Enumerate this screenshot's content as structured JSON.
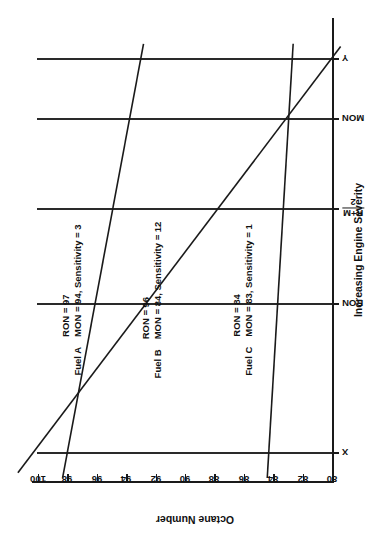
{
  "chart_data": {
    "type": "line",
    "title": "",
    "xlabel": "Increasing Engine Severity",
    "ylabel": "Octane Number",
    "x_tick_labels": [
      "X",
      "RON",
      "(R+M)/2",
      "MON",
      "Y"
    ],
    "x_tick_display": [
      "X",
      "RON",
      "R+M / 2",
      "MON",
      "Y"
    ],
    "y_tick_labels": [
      "100",
      "98",
      "96",
      "94",
      "92",
      "90",
      "88",
      "86",
      "84",
      "82",
      "80"
    ],
    "ylim": [
      80,
      100
    ],
    "grid": "both",
    "legend": "inline-annotations",
    "series": [
      {
        "name": "Fuel A",
        "ron": 97,
        "mon": 94,
        "sensitivity": 3,
        "points": [
          {
            "x": "X",
            "y": 98.0
          },
          {
            "x": "RON",
            "y": 97.0
          },
          {
            "x": "(R+M)/2",
            "y": 95.5
          },
          {
            "x": "MON",
            "y": 94.0
          },
          {
            "x": "Y",
            "y": 93.0
          }
        ]
      },
      {
        "name": "Fuel B",
        "ron": 96,
        "mon": 84,
        "sensitivity": 12,
        "points": [
          {
            "x": "X",
            "y": 100.3
          },
          {
            "x": "RON",
            "y": 96.0
          },
          {
            "x": "(R+M)/2",
            "y": 90.0
          },
          {
            "x": "MON",
            "y": 84.0
          },
          {
            "x": "Y",
            "y": 80.0
          }
        ]
      },
      {
        "name": "Fuel C",
        "ron": 84,
        "mon": 83,
        "sensitivity": 1,
        "points": [
          {
            "x": "X",
            "y": 84.3
          },
          {
            "x": "RON",
            "y": 84.0
          },
          {
            "x": "(R+M)/2",
            "y": 83.5
          },
          {
            "x": "MON",
            "y": 83.0
          },
          {
            "x": "Y",
            "y": 82.7
          }
        ]
      }
    ],
    "annotations": [
      {
        "name": "Fuel A",
        "line1": "RON = 97",
        "line2": "MON = 94, Sensitivity = 3"
      },
      {
        "name": "Fuel B",
        "line1": "RON = 96",
        "line2": "MON = 84, Sensitivity = 12"
      },
      {
        "name": "Fuel C",
        "line1": "RON = 84",
        "line2": "MON = 83, Sensitivity = 1"
      }
    ]
  },
  "axis": {
    "x_title": "Increasing Engine Severity",
    "y_title": "Octane Number",
    "frac_numerator": "R+M",
    "frac_denominator": "2"
  },
  "colors": {
    "ink": "#1a1a1a",
    "grid": "#2a2a2a",
    "background": "#ffffff"
  }
}
